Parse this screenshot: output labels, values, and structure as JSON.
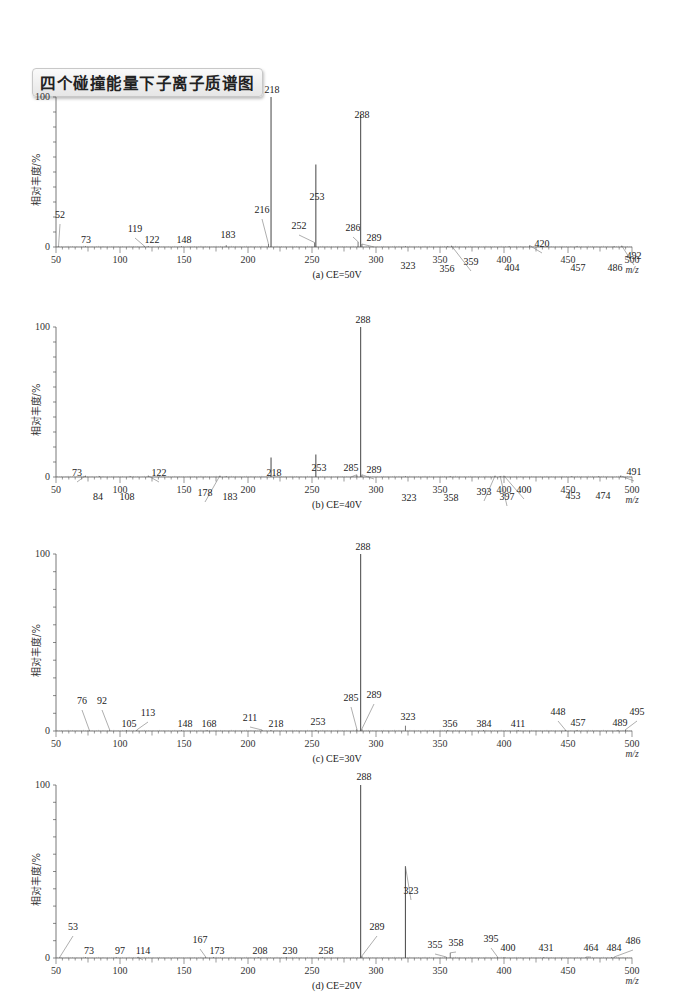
{
  "title": "四个碰撞能量下子离子质谱图",
  "chart_data": [
    {
      "type": "bar",
      "subtype": "mass-spectrum",
      "caption": "(a) CE=50V",
      "xlabel": "m/z",
      "ylabel": "相对丰度/%",
      "xlim": [
        50,
        500
      ],
      "ylim": [
        0,
        100
      ],
      "xticks": [
        50,
        100,
        150,
        200,
        250,
        300,
        350,
        400,
        450,
        500
      ],
      "yticks": [
        0,
        100
      ],
      "peaks": [
        {
          "mz": 52,
          "intensity": 0.5,
          "label": "52",
          "lx": 60,
          "ly": 218
        },
        {
          "mz": 73,
          "intensity": 0.3,
          "label": "73",
          "lx": 86,
          "ly": 243
        },
        {
          "mz": 119,
          "intensity": 0.6,
          "label": "119",
          "lx": 135,
          "ly": 232
        },
        {
          "mz": 122,
          "intensity": 0.3,
          "label": "122",
          "lx": 152,
          "ly": 243
        },
        {
          "mz": 148,
          "intensity": 0.3,
          "label": "148",
          "lx": 184,
          "ly": 243
        },
        {
          "mz": 183,
          "intensity": 1.2,
          "label": "183",
          "lx": 228,
          "ly": 238
        },
        {
          "mz": 216,
          "intensity": 2.0,
          "label": "216",
          "lx": 262,
          "ly": 213
        },
        {
          "mz": 218,
          "intensity": 100,
          "label": "218",
          "lx": 272,
          "ly": 93
        },
        {
          "mz": 252,
          "intensity": 3.0,
          "label": "252",
          "lx": 299,
          "ly": 229
        },
        {
          "mz": 253,
          "intensity": 55,
          "label": "253",
          "lx": 317,
          "ly": 200
        },
        {
          "mz": 286,
          "intensity": 3.5,
          "label": "286",
          "lx": 353,
          "ly": 231
        },
        {
          "mz": 288,
          "intensity": 88,
          "label": "288",
          "lx": 362,
          "ly": 118
        },
        {
          "mz": 289,
          "intensity": 2.0,
          "label": "289",
          "lx": 374,
          "ly": 241
        },
        {
          "mz": 323,
          "intensity": 0.3,
          "label": "323",
          "lx": 408,
          "ly": 269
        },
        {
          "mz": 356,
          "intensity": 0.3,
          "label": "356",
          "lx": 447,
          "ly": 272
        },
        {
          "mz": 359,
          "intensity": 0.8,
          "label": "359",
          "lx": 471,
          "ly": 265
        },
        {
          "mz": 404,
          "intensity": 0.3,
          "label": "404",
          "lx": 512,
          "ly": 271
        },
        {
          "mz": 420,
          "intensity": 1.0,
          "label": "420",
          "lx": 542,
          "ly": 247
        },
        {
          "mz": 457,
          "intensity": 0.3,
          "label": "457",
          "lx": 578,
          "ly": 271
        },
        {
          "mz": 486,
          "intensity": 0.3,
          "label": "486",
          "lx": 615,
          "ly": 271
        },
        {
          "mz": 492,
          "intensity": 0.8,
          "label": "492",
          "lx": 634,
          "ly": 259
        }
      ]
    },
    {
      "type": "bar",
      "subtype": "mass-spectrum",
      "caption": "(b) CE=40V",
      "xlabel": "m/z",
      "ylabel": "相对丰度/%",
      "xlim": [
        50,
        500
      ],
      "ylim": [
        0,
        100
      ],
      "xticks": [
        50,
        100,
        150,
        200,
        250,
        300,
        350,
        400,
        450,
        500
      ],
      "yticks": [
        0,
        100
      ],
      "peaks": [
        {
          "mz": 73,
          "intensity": 0.8,
          "label": "73",
          "lx": 77,
          "ly": 476
        },
        {
          "mz": 84,
          "intensity": 0.3,
          "label": "84",
          "lx": 98,
          "ly": 500
        },
        {
          "mz": 108,
          "intensity": 0.3,
          "label": "108",
          "lx": 127,
          "ly": 500
        },
        {
          "mz": 122,
          "intensity": 0.8,
          "label": "122",
          "lx": 159,
          "ly": 476
        },
        {
          "mz": 178,
          "intensity": 0.8,
          "label": "178",
          "lx": 205,
          "ly": 496
        },
        {
          "mz": 183,
          "intensity": 0.3,
          "label": "183",
          "lx": 230,
          "ly": 500
        },
        {
          "mz": 218,
          "intensity": 13,
          "label": "218",
          "lx": 274,
          "ly": 476
        },
        {
          "mz": 253,
          "intensity": 15,
          "label": "253",
          "lx": 319,
          "ly": 471
        },
        {
          "mz": 285,
          "intensity": 1.5,
          "label": "285",
          "lx": 351,
          "ly": 471
        },
        {
          "mz": 288,
          "intensity": 100,
          "label": "288",
          "lx": 363,
          "ly": 323
        },
        {
          "mz": 289,
          "intensity": 1.5,
          "label": "289",
          "lx": 374,
          "ly": 473
        },
        {
          "mz": 323,
          "intensity": 0.3,
          "label": "323",
          "lx": 409,
          "ly": 501
        },
        {
          "mz": 358,
          "intensity": 0.3,
          "label": "358",
          "lx": 451,
          "ly": 501
        },
        {
          "mz": 393,
          "intensity": 0.8,
          "label": "393",
          "lx": 484,
          "ly": 495
        },
        {
          "mz": 397,
          "intensity": 0.3,
          "label": "397",
          "lx": 507,
          "ly": 500
        },
        {
          "mz": 400,
          "intensity": 0.8,
          "label": "400",
          "lx": 524,
          "ly": 493
        },
        {
          "mz": 453,
          "intensity": 0.3,
          "label": "453",
          "lx": 573,
          "ly": 499
        },
        {
          "mz": 474,
          "intensity": 0.3,
          "label": "474",
          "lx": 603,
          "ly": 499
        },
        {
          "mz": 491,
          "intensity": 0.8,
          "label": "491",
          "lx": 634,
          "ly": 475
        }
      ]
    },
    {
      "type": "bar",
      "subtype": "mass-spectrum",
      "caption": "(c) CE=30V",
      "xlabel": "m/z",
      "ylabel": "相对丰度/%",
      "xlim": [
        50,
        500
      ],
      "ylim": [
        0,
        100
      ],
      "xticks": [
        50,
        100,
        150,
        200,
        250,
        300,
        350,
        400,
        450,
        500
      ],
      "yticks": [
        0,
        100
      ],
      "peaks": [
        {
          "mz": 76,
          "intensity": 0.5,
          "label": "76",
          "lx": 82,
          "ly": 704
        },
        {
          "mz": 92,
          "intensity": 0.5,
          "label": "92",
          "lx": 102,
          "ly": 704
        },
        {
          "mz": 105,
          "intensity": 0.3,
          "label": "105",
          "lx": 129,
          "ly": 727
        },
        {
          "mz": 113,
          "intensity": 0.5,
          "label": "113",
          "lx": 148,
          "ly": 716
        },
        {
          "mz": 148,
          "intensity": 0.3,
          "label": "148",
          "lx": 185,
          "ly": 727
        },
        {
          "mz": 168,
          "intensity": 0.3,
          "label": "168",
          "lx": 209,
          "ly": 727
        },
        {
          "mz": 211,
          "intensity": 0.5,
          "label": "211",
          "lx": 250,
          "ly": 721
        },
        {
          "mz": 218,
          "intensity": 0.3,
          "label": "218",
          "lx": 276,
          "ly": 727
        },
        {
          "mz": 253,
          "intensity": 0.3,
          "label": "253",
          "lx": 318,
          "ly": 725
        },
        {
          "mz": 285,
          "intensity": 1.2,
          "label": "285",
          "lx": 351,
          "ly": 701
        },
        {
          "mz": 288,
          "intensity": 100,
          "label": "288",
          "lx": 363,
          "ly": 550
        },
        {
          "mz": 289,
          "intensity": 1.2,
          "label": "289",
          "lx": 374,
          "ly": 698
        },
        {
          "mz": 323,
          "intensity": 3.0,
          "label": "323",
          "lx": 408,
          "ly": 720
        },
        {
          "mz": 356,
          "intensity": 0.3,
          "label": "356",
          "lx": 450,
          "ly": 727
        },
        {
          "mz": 384,
          "intensity": 0.3,
          "label": "384",
          "lx": 484,
          "ly": 727
        },
        {
          "mz": 411,
          "intensity": 0.3,
          "label": "411",
          "lx": 518,
          "ly": 727
        },
        {
          "mz": 448,
          "intensity": 0.5,
          "label": "448",
          "lx": 558,
          "ly": 715
        },
        {
          "mz": 457,
          "intensity": 0.3,
          "label": "457",
          "lx": 578,
          "ly": 726
        },
        {
          "mz": 489,
          "intensity": 0.3,
          "label": "489",
          "lx": 620,
          "ly": 726
        },
        {
          "mz": 495,
          "intensity": 0.8,
          "label": "495",
          "lx": 637,
          "ly": 715
        }
      ]
    },
    {
      "type": "bar",
      "subtype": "mass-spectrum",
      "caption": "(d) CE=20V",
      "xlabel": "m/z",
      "ylabel": "相对丰度/%",
      "xlim": [
        50,
        500
      ],
      "ylim": [
        0,
        100
      ],
      "xticks": [
        50,
        100,
        150,
        200,
        250,
        300,
        350,
        400,
        450,
        500
      ],
      "yticks": [
        0,
        100
      ],
      "peaks": [
        {
          "mz": 53,
          "intensity": 0.5,
          "label": "53",
          "lx": 73,
          "ly": 930
        },
        {
          "mz": 73,
          "intensity": 0.3,
          "label": "73",
          "lx": 89,
          "ly": 954
        },
        {
          "mz": 97,
          "intensity": 0.3,
          "label": "97",
          "lx": 120,
          "ly": 954
        },
        {
          "mz": 114,
          "intensity": 0.3,
          "label": "114",
          "lx": 143,
          "ly": 954
        },
        {
          "mz": 167,
          "intensity": 0.5,
          "label": "167",
          "lx": 200,
          "ly": 943
        },
        {
          "mz": 173,
          "intensity": 0.3,
          "label": "173",
          "lx": 217,
          "ly": 954
        },
        {
          "mz": 208,
          "intensity": 0.3,
          "label": "208",
          "lx": 260,
          "ly": 954
        },
        {
          "mz": 230,
          "intensity": 0.3,
          "label": "230",
          "lx": 290,
          "ly": 954
        },
        {
          "mz": 258,
          "intensity": 0.3,
          "label": "258",
          "lx": 326,
          "ly": 954
        },
        {
          "mz": 288,
          "intensity": 100,
          "label": "288",
          "lx": 364,
          "ly": 780
        },
        {
          "mz": 289,
          "intensity": 1.2,
          "label": "289",
          "lx": 377,
          "ly": 930
        },
        {
          "mz": 323,
          "intensity": 53,
          "label": "323",
          "lx": 411,
          "ly": 894
        },
        {
          "mz": 355,
          "intensity": 0.3,
          "label": "355",
          "lx": 435,
          "ly": 948
        },
        {
          "mz": 358,
          "intensity": 3.0,
          "label": "358",
          "lx": 456,
          "ly": 946
        },
        {
          "mz": 395,
          "intensity": 0.5,
          "label": "395",
          "lx": 491,
          "ly": 942
        },
        {
          "mz": 400,
          "intensity": 0.3,
          "label": "400",
          "lx": 508,
          "ly": 951
        },
        {
          "mz": 431,
          "intensity": 0.3,
          "label": "431",
          "lx": 546,
          "ly": 951
        },
        {
          "mz": 464,
          "intensity": 0.3,
          "label": "464",
          "lx": 591,
          "ly": 951
        },
        {
          "mz": 484,
          "intensity": 0.3,
          "label": "484",
          "lx": 614,
          "ly": 951
        },
        {
          "mz": 486,
          "intensity": 0.5,
          "label": "486",
          "lx": 633,
          "ly": 944
        }
      ]
    }
  ],
  "layout": {
    "panels": [
      {
        "top": 97,
        "base": 247,
        "caption_y": 292
      },
      {
        "top": 327,
        "base": 477,
        "caption_y": 522
      },
      {
        "top": 554,
        "base": 731,
        "caption_y": 777
      },
      {
        "top": 785,
        "base": 958,
        "caption_y": 1001
      }
    ],
    "x0_px": 56,
    "x1_px": 632,
    "axis_x_px": 56,
    "line_color": "#555555"
  }
}
